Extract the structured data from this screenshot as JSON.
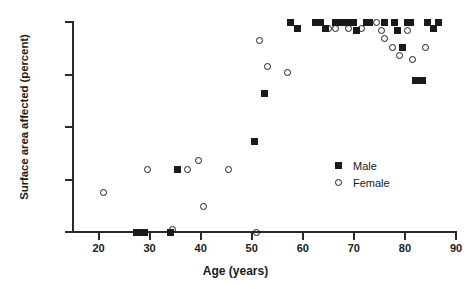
{
  "chart_data": {
    "type": "scatter",
    "title": "",
    "xlabel": "Age (years)",
    "ylabel": "Surface area affected (percent)",
    "xlim": [
      15,
      90
    ],
    "ylim": [
      0,
      100
    ],
    "xticks": [
      20,
      30,
      40,
      50,
      60,
      70,
      80,
      90
    ],
    "yticks": [
      0,
      25,
      50,
      75,
      100
    ],
    "grid": false,
    "legend_position": "center-right",
    "series": [
      {
        "name": "Male",
        "marker": "filled-square",
        "color": "#1a1a1a",
        "points": [
          [
            27.5,
            0
          ],
          [
            28.2,
            0
          ],
          [
            29.0,
            0
          ],
          [
            34.0,
            0
          ],
          [
            35.5,
            30
          ],
          [
            50.5,
            43
          ],
          [
            52.5,
            66
          ],
          [
            57.5,
            100
          ],
          [
            59.0,
            97
          ],
          [
            62.5,
            100
          ],
          [
            63.5,
            100
          ],
          [
            64.5,
            97
          ],
          [
            66.5,
            100
          ],
          [
            67.5,
            100
          ],
          [
            68.5,
            100
          ],
          [
            70.0,
            100
          ],
          [
            70.5,
            96
          ],
          [
            72.5,
            100
          ],
          [
            73.0,
            100
          ],
          [
            76.0,
            100
          ],
          [
            78.0,
            100
          ],
          [
            78.5,
            96
          ],
          [
            79.5,
            88
          ],
          [
            80.5,
            100
          ],
          [
            81.0,
            100
          ],
          [
            82.0,
            72
          ],
          [
            83.5,
            72
          ],
          [
            84.5,
            100
          ],
          [
            85.5,
            97
          ],
          [
            86.5,
            100
          ]
        ]
      },
      {
        "name": "Female",
        "marker": "open-circle",
        "color": "#1a1a1a",
        "points": [
          [
            21.0,
            19
          ],
          [
            29.5,
            30
          ],
          [
            34.5,
            1
          ],
          [
            37.5,
            30
          ],
          [
            39.5,
            34
          ],
          [
            40.5,
            12
          ],
          [
            45.5,
            30
          ],
          [
            51.0,
            0
          ],
          [
            51.5,
            91
          ],
          [
            53.0,
            79
          ],
          [
            57.0,
            76
          ],
          [
            63.5,
            100
          ],
          [
            65.0,
            97
          ],
          [
            66.5,
            97
          ],
          [
            69.0,
            97
          ],
          [
            71.5,
            97
          ],
          [
            74.5,
            100
          ],
          [
            75.5,
            96
          ],
          [
            76.0,
            92
          ],
          [
            77.5,
            88
          ],
          [
            79.0,
            84
          ],
          [
            80.5,
            96
          ],
          [
            81.5,
            82
          ],
          [
            84.0,
            88
          ]
        ]
      }
    ]
  },
  "legend": {
    "male_label": "Male",
    "female_label": "Female"
  }
}
